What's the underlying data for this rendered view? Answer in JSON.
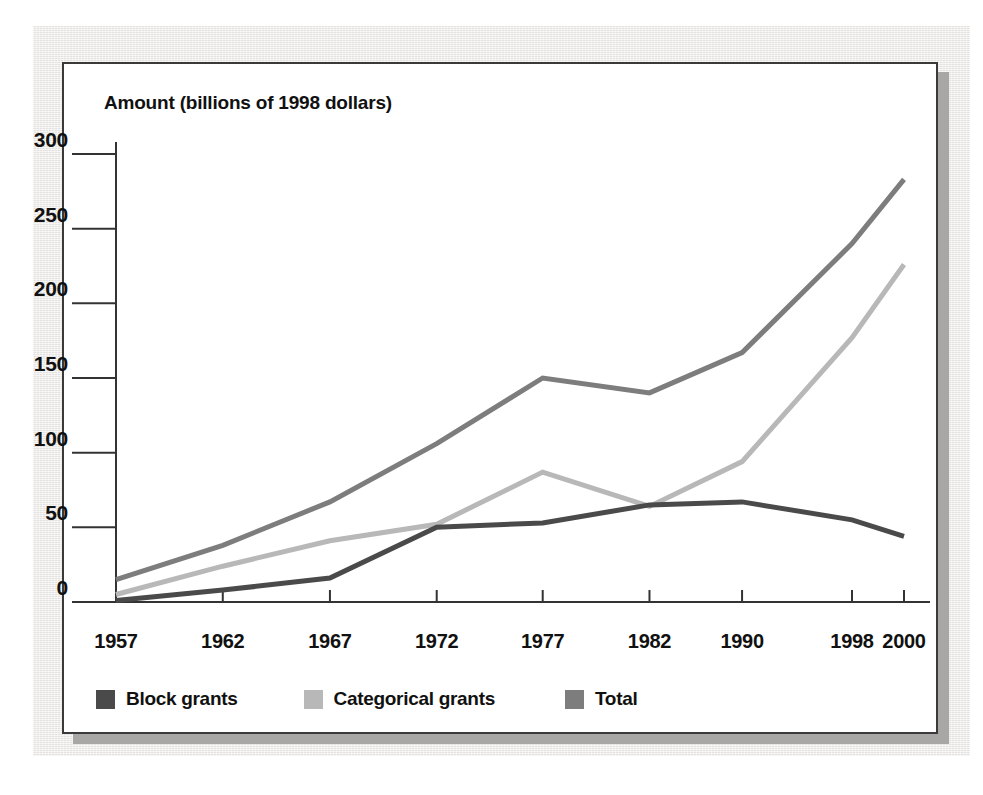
{
  "chart_data": {
    "type": "line",
    "title": "",
    "ylabel": "Amount (billions of 1998 dollars)",
    "xlabel": "",
    "categories": [
      "1957",
      "1962",
      "1967",
      "1972",
      "1977",
      "1982",
      "1990",
      "1998",
      "2000"
    ],
    "yticks": [
      "0",
      "50",
      "100",
      "150",
      "200",
      "250",
      "300"
    ],
    "ylim": [
      0,
      300
    ],
    "grid": false,
    "legend_position": "bottom-left",
    "series": [
      {
        "name": "Block grants",
        "color": "#4a4a4a",
        "values": [
          1,
          8,
          16,
          50,
          53,
          65,
          67,
          55,
          44
        ]
      },
      {
        "name": "Categorical grants",
        "color": "#b8b8b8",
        "values": [
          5,
          24,
          41,
          52,
          87,
          64,
          94,
          177,
          226
        ]
      },
      {
        "name": "Total",
        "color": "#7d7d7d",
        "values": [
          15,
          38,
          67,
          106,
          150,
          140,
          167,
          240,
          283
        ]
      }
    ]
  },
  "legend": {
    "items": [
      {
        "label": "Block grants",
        "color": "#4a4a4a"
      },
      {
        "label": "Categorical grants",
        "color": "#b8b8b8"
      },
      {
        "label": "Total",
        "color": "#7d7d7d"
      }
    ]
  }
}
